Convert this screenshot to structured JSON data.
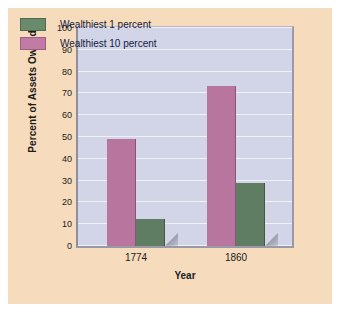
{
  "chart_data": {
    "type": "bar",
    "title": "",
    "xlabel": "Year",
    "ylabel": "Percent of Assets Owned",
    "categories": [
      "1774",
      "1860"
    ],
    "series": [
      {
        "name": "Wealthiest 1 percent",
        "values": [
          12.5,
          29
        ],
        "color": "#5f7d63"
      },
      {
        "name": "Wealthiest 10 percent",
        "values": [
          49,
          73.5
        ],
        "color": "#b8759d"
      }
    ],
    "series_order_in_plot": [
      "Wealthiest 10 percent",
      "Wealthiest 1 percent"
    ],
    "ylim": [
      0,
      100
    ],
    "ytick_step": 10,
    "yticks": [
      "100",
      "90",
      "80",
      "70",
      "60",
      "50",
      "40",
      "30",
      "20",
      "10",
      "0"
    ],
    "grid": true,
    "legend_position": "top-left"
  },
  "colors": {
    "page_background": "#f6dcbd",
    "plot_background": "#d2d4e7",
    "plot_border": "#9a9aa6",
    "gridline": "#f0f1f8",
    "bar_green": "#5f7d63",
    "bar_pink": "#b8759d",
    "text": "#1b1b1b",
    "legend_text": "#12213f"
  }
}
